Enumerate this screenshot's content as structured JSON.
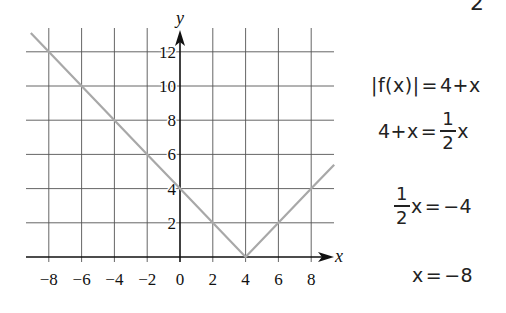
{
  "chart_data": {
    "type": "line",
    "title": "",
    "xlabel": "x",
    "ylabel": "y",
    "xlim": [
      -9.1,
      9.4
    ],
    "ylim": [
      0,
      13.1
    ],
    "grid": true,
    "x_ticks": [
      -8,
      -6,
      -4,
      -2,
      0,
      2,
      4,
      6,
      8
    ],
    "y_ticks": [
      2,
      4,
      6,
      8,
      10,
      12
    ],
    "x_tick_labels": [
      "−8",
      "−6",
      "−4",
      "−2",
      "0",
      "2",
      "4",
      "6",
      "8"
    ],
    "y_tick_labels": [
      "2",
      "4",
      "6",
      "8",
      "10",
      "12"
    ],
    "series": [
      {
        "name": "|f(x)| = |x − 4|",
        "color": "#a8a8a8",
        "x": [
          -9.1,
          -8,
          -6,
          -4,
          -2,
          0,
          2,
          4,
          6,
          8,
          9.4
        ],
        "y": [
          13.1,
          12,
          10,
          8,
          6,
          4,
          2,
          0,
          2,
          4,
          5.4
        ]
      }
    ]
  },
  "corner_text": "2",
  "equations": {
    "line1": {
      "left": "|f(x)|",
      "eq": "=",
      "right": "4+x"
    },
    "line2": {
      "left": "4+x",
      "eq": "=",
      "num": "1",
      "den": "2",
      "var": "x"
    },
    "line3": {
      "num": "1",
      "den": "2",
      "var": "x",
      "eq": "=",
      "right": "−4"
    },
    "line4": {
      "left": "x",
      "eq": "=",
      "right": "−8"
    }
  }
}
